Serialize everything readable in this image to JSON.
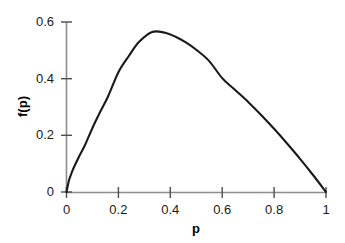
{
  "chart_data": {
    "type": "line",
    "title": "",
    "subtitle": "",
    "xlabel": "p",
    "ylabel": "f(p)",
    "xlim": [
      0,
      1
    ],
    "ylim": [
      0,
      0.6
    ],
    "grid": false,
    "legend": null,
    "legend_position": "none",
    "x_ticks": [
      0,
      0.2,
      0.4,
      0.6,
      0.8,
      1
    ],
    "x_tick_labels": [
      "0",
      "0.2",
      "0.4",
      "0.6",
      "0.8",
      "1"
    ],
    "y_ticks": [
      0,
      0.2,
      0.4,
      0.6
    ],
    "y_tick_labels": [
      "0",
      "0.2",
      "0.4",
      "0.6"
    ],
    "line_color": "#1a1a1a",
    "axis_color": "#808080",
    "series": [
      {
        "name": "f(p)",
        "x": [
          0.0,
          0.01,
          0.02,
          0.03,
          0.05,
          0.07,
          0.1,
          0.13,
          0.16,
          0.2,
          0.24,
          0.28,
          0.33,
          0.38,
          0.42,
          0.46,
          0.5,
          0.55,
          0.6,
          0.65,
          0.7,
          0.75,
          0.8,
          0.85,
          0.9,
          0.95,
          1.0
        ],
        "y": [
          0.0,
          0.042,
          0.068,
          0.09,
          0.128,
          0.163,
          0.226,
          0.283,
          0.337,
          0.423,
          0.48,
          0.53,
          0.565,
          0.562,
          0.548,
          0.528,
          0.502,
          0.462,
          0.402,
          0.36,
          0.318,
          0.272,
          0.223,
          0.171,
          0.117,
          0.06,
          0.0
        ]
      }
    ],
    "peak": {
      "x": 0.33,
      "y": 0.565
    }
  },
  "axes_labels": {
    "x_axis_title": "p",
    "y_axis_title": "f(p)"
  }
}
